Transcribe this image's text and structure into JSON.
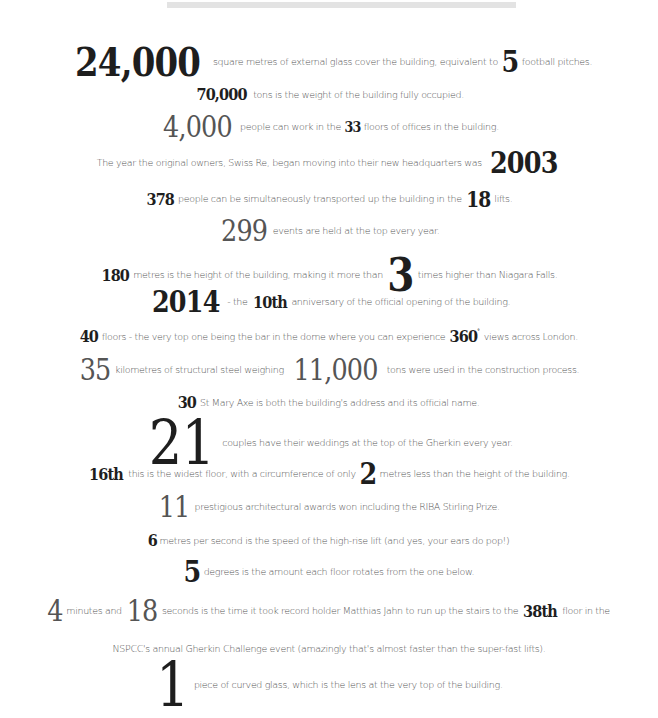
{
  "top_bar": {
    "color": "#e3e3e3"
  },
  "facts": [
    {
      "n1": "24,000",
      "t1": "square metres of external glass cover the building, equivalent to",
      "n2": "5",
      "t2": "football pitches."
    },
    {
      "n1": "70,000",
      "t1": "tons is the weight of the building fully occupied."
    },
    {
      "n1": "4,000",
      "t1": "people can work in the",
      "n2": "33",
      "t2": "floors of offices in the building."
    },
    {
      "t1": "The year the original owners, Swiss Re, began moving into their new headquarters was",
      "n1": "2003"
    },
    {
      "n1": "378",
      "t1": "people can be simultaneously transported up the building in the",
      "n2": "18",
      "t2": "lifts."
    },
    {
      "n1": "299",
      "t1": "events are held at the top every year."
    },
    {
      "n1": "180",
      "t1": "metres is the height of the building, making it more than",
      "n2": "3",
      "t2": "times higher than Niagara Falls."
    },
    {
      "n1": "2014",
      "t1": "- the",
      "n2": "10th",
      "t2": "anniversary of the official opening of the building."
    },
    {
      "n1": "40",
      "t1": "floors - the very top one being the bar in the dome where you can experience",
      "n2": "360",
      "n2_sup": "°",
      "t2": "views across London."
    },
    {
      "n1": "35",
      "t1": "kilometres of structural steel weighing",
      "n2": "11,000",
      "t2": "tons were used in the construction process."
    },
    {
      "n1": "30",
      "t1": "St Mary Axe is both the building's address and its official name."
    },
    {
      "n1": "21",
      "t1": "couples have their weddings at the top of the Gherkin every year."
    },
    {
      "n1": "16th",
      "t1": "this is the widest floor, with a circumference of only",
      "n2": "2",
      "t2": "metres less than the height of the building."
    },
    {
      "n1": "11",
      "t1": "prestigious architectural awards won including the RIBA Stirling Prize."
    },
    {
      "n1": "6",
      "t1": "metres per second is the speed of the high-rise lift (and yes, your ears do pop!)"
    },
    {
      "n1": "5",
      "t1": "degrees is the amount each floor rotates from the one below."
    },
    {
      "n1": "4",
      "t1": "minutes and",
      "n2": "18",
      "t2": "seconds is the time it took record holder Matthias Jahn to run up the stairs to the",
      "n3": "38th",
      "t3": "floor in the"
    },
    {
      "t1": "NSPCC's annual Gherkin Challenge event (amazingly that's almost faster than the super-fast lifts)."
    },
    {
      "n1": "1",
      "t1": "piece of curved glass, which is the lens at the very top of the building."
    }
  ]
}
